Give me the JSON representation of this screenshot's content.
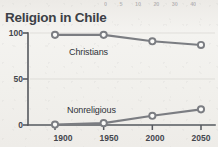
{
  "chart_data": {
    "type": "line",
    "title": "Religion in Chile",
    "xlabel": "",
    "ylabel": "",
    "x": [
      1900,
      1950,
      2000,
      2050
    ],
    "xticklabels": [
      "1900",
      "1950",
      "2000",
      "2050"
    ],
    "yticklabels": [
      "0",
      "50",
      "100"
    ],
    "yticks": [
      0,
      50,
      100
    ],
    "ylim": [
      0,
      100
    ],
    "xlim": [
      1885,
      2065
    ],
    "grid": "horizontal-faint",
    "legend": "inline-labels",
    "marker": "open-circle",
    "series": [
      {
        "name": "Christians",
        "values": [
          98,
          98,
          91,
          87
        ],
        "color": "#7b7d82",
        "label_text": "Christians"
      },
      {
        "name": "Nonreligious",
        "values": [
          0.5,
          2,
          10,
          17
        ],
        "color": "#7b7d82",
        "label_text": "Nonreligious"
      }
    ]
  },
  "header": {
    "title": "Religion in Chile"
  },
  "axes": {
    "y": {
      "labels": [
        "100",
        "50",
        "0"
      ]
    },
    "x": {
      "labels": [
        "1900",
        "1950",
        "2000",
        "2050"
      ]
    }
  },
  "labels": {
    "christians": "Christians",
    "nonreligious": "Nonreligious"
  },
  "top_bleed": {
    "values": [
      "0",
      "5",
      "10",
      "20",
      "30",
      "40"
    ]
  },
  "colors": {
    "line": "#7b7d82",
    "axis": "#55585e",
    "text": "#3c3f46",
    "marker_fill": "#fbfbf9",
    "grid": "#cfcdc8",
    "background": "#f2f1ee"
  }
}
